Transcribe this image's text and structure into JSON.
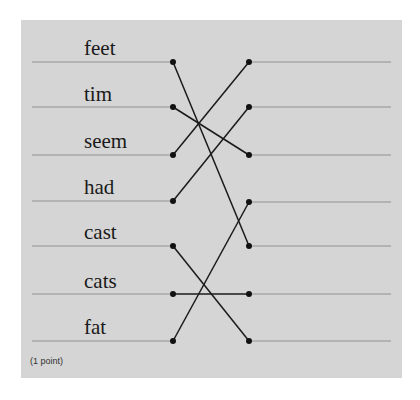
{
  "question": {
    "points_label": "(1 point)",
    "left_items": [
      {
        "label": "feet",
        "y": 62
      },
      {
        "label": "tim",
        "y": 107
      },
      {
        "label": "seem",
        "y": 155
      },
      {
        "label": "had",
        "y": 201
      },
      {
        "label": "cast",
        "y": 246
      },
      {
        "label": "cats",
        "y": 294
      },
      {
        "label": "fat",
        "y": 341
      }
    ],
    "right_slots_y": [
      62,
      107,
      155,
      202,
      246,
      294,
      341
    ],
    "connections": [
      {
        "from": 0,
        "to": 4
      },
      {
        "from": 1,
        "to": 2
      },
      {
        "from": 2,
        "to": 0
      },
      {
        "from": 3,
        "to": 1
      },
      {
        "from": 4,
        "to": 6
      },
      {
        "from": 5,
        "to": 5
      },
      {
        "from": 6,
        "to": 3
      }
    ]
  },
  "colors": {
    "panel": "#d5d5d5",
    "rule_line": "#b3b3b3",
    "connector": "#1a1a1a",
    "dot": "#111111"
  }
}
